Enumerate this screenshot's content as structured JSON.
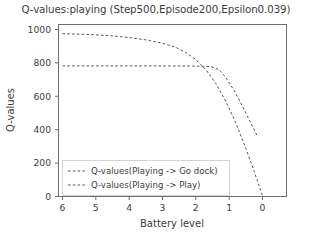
{
  "chart_data": {
    "type": "line",
    "title": "Q-values:playing (Step500,Episode200,Epsilon0.039)",
    "xlabel": "Battery level",
    "ylabel": "Q-values",
    "xlim": [
      6,
      0
    ],
    "ylim": [
      0,
      1000
    ],
    "x_ticks": [
      "6",
      "5",
      "4",
      "3",
      "2",
      "1",
      "0"
    ],
    "x_tick_values": [
      6,
      5,
      4,
      3,
      2,
      1,
      0
    ],
    "y_ticks": [
      "0",
      "200",
      "400",
      "600",
      "800",
      "1000"
    ],
    "y_tick_values": [
      0,
      200,
      400,
      600,
      800,
      1000
    ],
    "x_axis_inverted": true,
    "grid": false,
    "legend_position": "lower left",
    "line_style": "dashed",
    "line_color": "#555555",
    "series": [
      {
        "name": "Q-values(Playing -> Go dock)",
        "x": [
          6.0,
          5.5,
          5.0,
          4.5,
          4.0,
          3.5,
          3.0,
          2.6,
          2.3,
          2.0,
          1.7,
          1.4,
          1.1,
          0.8,
          0.5,
          0.25,
          0.0
        ],
        "values": [
          975,
          972,
          968,
          962,
          952,
          938,
          918,
          893,
          862,
          820,
          760,
          676,
          570,
          440,
          288,
          150,
          5
        ]
      },
      {
        "name": "Q-values(Playing -> Play)",
        "x": [
          6.0,
          5.0,
          4.0,
          3.0,
          2.0,
          1.55,
          1.3,
          1.1,
          0.85,
          0.6,
          0.35,
          0.15
        ],
        "values": [
          782,
          782,
          782,
          782,
          781,
          778,
          760,
          712,
          635,
          540,
          440,
          360
        ]
      }
    ]
  },
  "legend": {
    "items": [
      {
        "label": "Q-values(Playing -> Go dock)"
      },
      {
        "label": "Q-values(Playing -> Play)"
      }
    ]
  }
}
